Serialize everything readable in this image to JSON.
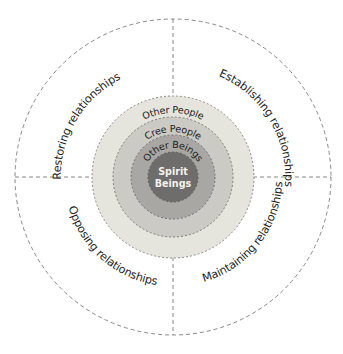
{
  "diagram": {
    "type": "concentric-circles-with-quadrants",
    "quadrants": [
      {
        "position": "top-left",
        "label": "Restoring relationships"
      },
      {
        "position": "top-right",
        "label": "Establishing relationships"
      },
      {
        "position": "bottom-left",
        "label": "Opposing relationships"
      },
      {
        "position": "bottom-right",
        "label": "Maintaining relationships"
      }
    ],
    "rings": [
      {
        "label": "Other People",
        "color": "#e6e5dd"
      },
      {
        "label": "Cree People",
        "color": "#cbcac4"
      },
      {
        "label": "Other Beings",
        "color": "#a8a7a3"
      }
    ],
    "core": {
      "line1": "Spirit",
      "line2": "Beings",
      "color": "#6e6d6b"
    },
    "line_color": "#7a7a7a"
  }
}
